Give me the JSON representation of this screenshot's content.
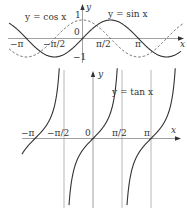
{
  "chart_data": [
    {
      "type": "line",
      "title": "",
      "xlabel": "x",
      "ylabel": "y",
      "x_ticks": [
        "−π",
        "−π/2",
        "π/2",
        "π"
      ],
      "y_ticks": [
        "1",
        "0",
        "−1"
      ],
      "xlim": [
        -3.14159,
        3.14159
      ],
      "ylim": [
        -1,
        1
      ],
      "grid": false,
      "series": [
        {
          "name": "y = sin x",
          "style": "solid",
          "function": "sin(x)",
          "x": [
            -3.1416,
            -2.3562,
            -1.5708,
            -0.7854,
            0,
            0.7854,
            1.5708,
            2.3562,
            3.1416,
            3.927
          ],
          "values": [
            0,
            -0.707,
            -1,
            -0.707,
            0,
            0.707,
            1,
            0.707,
            0,
            -0.707
          ]
        },
        {
          "name": "y = cos x",
          "style": "dashed",
          "function": "cos(x)",
          "x": [
            -3.1416,
            -2.3562,
            -1.5708,
            -0.7854,
            0,
            0.7854,
            1.5708,
            2.3562,
            3.1416,
            3.927
          ],
          "values": [
            -1,
            -0.707,
            0,
            0.707,
            1,
            0.707,
            0,
            -0.707,
            -1,
            -0.707
          ]
        }
      ]
    },
    {
      "type": "line",
      "title": "",
      "xlabel": "x",
      "ylabel": "y",
      "x_ticks": [
        "−π",
        "−π/2",
        "0",
        "π/2",
        "π"
      ],
      "xlim": [
        -4.4,
        4.7
      ],
      "grid": false,
      "asymptotes": [
        "−π/2",
        "π/2",
        "3π/2"
      ],
      "series": [
        {
          "name": "y = tan x",
          "style": "solid",
          "function": "tan(x)",
          "x": [
            -3.9,
            -3.1416,
            -2.36,
            -1.8,
            -1.3,
            -0.785,
            0,
            0.785,
            1.3,
            1.85,
            2.36,
            3.1416,
            3.93,
            4.45
          ],
          "values": [
            -0.98,
            0,
            1,
            4.3,
            -3.6,
            -1,
            0,
            1,
            3.6,
            -3.4,
            -1,
            0,
            1,
            5.5
          ]
        }
      ]
    }
  ],
  "labels": {
    "top": {
      "sin": "y = sin x",
      "cos": "y = cos x",
      "y": "y",
      "x": "x",
      "one": "1",
      "neg_one": "−1",
      "zero": "0",
      "neg_pi": "−π",
      "neg_half_pi": "−π/2",
      "half_pi": "π/2",
      "pi": "π"
    },
    "bottom": {
      "tan": "y = tan x",
      "y": "y",
      "x": "x",
      "zero": "0",
      "neg_pi": "−π",
      "neg_half_pi": "−π/2",
      "half_pi": "π/2",
      "pi": "π"
    }
  }
}
